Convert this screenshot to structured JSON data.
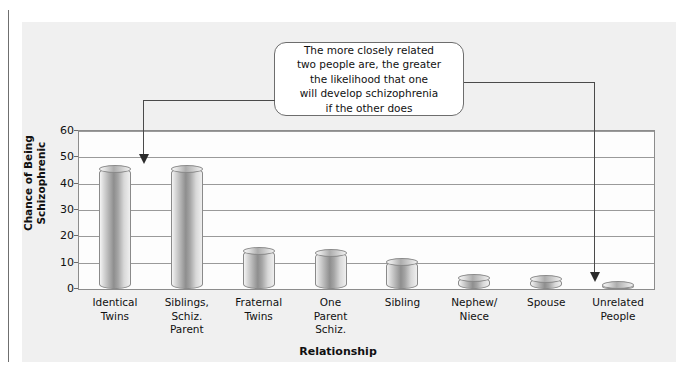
{
  "chart_data": {
    "type": "bar",
    "title": "",
    "xlabel": "Relationship",
    "ylabel": "Chance of Being Schizophrenic",
    "categories": [
      "Identical Twins",
      "Siblings, Schiz. Parent",
      "Fraternal Twins",
      "One Parent Schiz.",
      "Sibling",
      "Nephew/ Niece",
      "Spouse",
      "Unrelated People"
    ],
    "category_lines": [
      [
        "Identical",
        "Twins"
      ],
      [
        "Siblings,",
        "Schiz.",
        "Parent"
      ],
      [
        "Fraternal",
        "Twins"
      ],
      [
        "One",
        "Parent",
        "Schiz."
      ],
      [
        "Sibling"
      ],
      [
        "Nephew/",
        "Niece"
      ],
      [
        "Spouse"
      ],
      [
        "Unrelated",
        "People"
      ]
    ],
    "values": [
      46,
      46,
      15,
      14,
      10.5,
      4.5,
      4,
      2
    ],
    "ylim": [
      0,
      60
    ],
    "ytick_labels": [
      "0",
      "10",
      "20",
      "30",
      "40",
      "50",
      "60"
    ],
    "ytick_values": [
      0,
      10,
      20,
      30,
      40,
      50,
      60
    ],
    "grid": true,
    "legend": "none"
  },
  "annotation": {
    "callout_text": "The more closely related two people are, the greater the likelihood that one will develop schizophrenia if the other does",
    "callout_lines": [
      "The more closely related",
      "two people are, the greater",
      "the likelihood that one",
      "will develop schizophrenia",
      "if the other does"
    ],
    "points_to": [
      "Identical Twins",
      "Unrelated People"
    ]
  },
  "style": {
    "panel_background": "#f0f0f0",
    "plot_background": "#fdfdfd",
    "grid_color": "#9a9a9a",
    "bar_color": "#8e8e8e",
    "text_color": "#111111",
    "callout_border": "#6d6d6d",
    "leader_color": "#4a4a4a"
  }
}
